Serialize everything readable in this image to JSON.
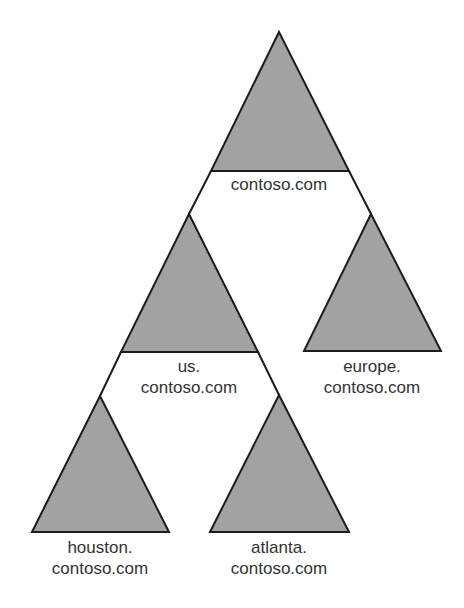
{
  "diagram": {
    "type": "domain-tree",
    "colors": {
      "triangle_fill": "#a2a2a2",
      "line": "#1c1c1c",
      "text": "#333333",
      "background": "#ffffff"
    },
    "nodes": [
      {
        "id": "root",
        "line1": "contoso.com",
        "line2": "",
        "parent": null
      },
      {
        "id": "us",
        "line1": "us.",
        "line2": "contoso.com",
        "parent": "root"
      },
      {
        "id": "europe",
        "line1": "europe.",
        "line2": "contoso.com",
        "parent": "root"
      },
      {
        "id": "houston",
        "line1": "houston.",
        "line2": "contoso.com",
        "parent": "us"
      },
      {
        "id": "atlanta",
        "line1": "atlanta.",
        "line2": "contoso.com",
        "parent": "us"
      }
    ]
  }
}
